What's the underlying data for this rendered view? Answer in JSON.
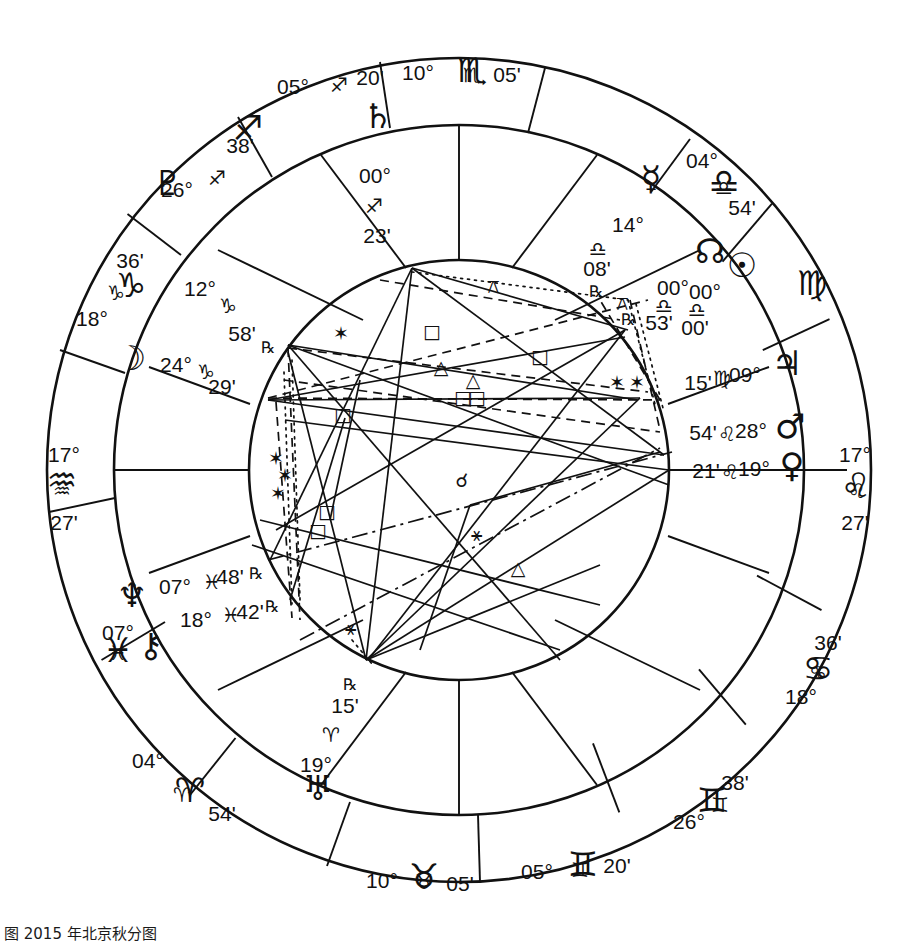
{
  "chart_data": {
    "type": "other",
    "caption": "å¾ 2015 年北京秋分图",
    "wheel": {
      "center_x": 459,
      "center_y": 470,
      "outer_radius": 415,
      "zodiac_inner_radius": 340,
      "house_ring_radius": 285,
      "inner_circle_radius": 210
    },
    "angles": {
      "ascendant": {
        "deg": "17°",
        "sign": "♌",
        "min": "27'",
        "label": "Ascendant"
      },
      "descendant": {
        "deg": "17°",
        "sign": "♒",
        "min": "27'",
        "label": "Descendant"
      },
      "midheaven": {
        "deg": "10°",
        "sign": "♏",
        "min": "05'",
        "label": "Midheaven"
      },
      "imum_coeli": {
        "deg": "10°",
        "sign": "♉",
        "min": "05'",
        "label": "Imum Coeli"
      }
    },
    "cusps": [
      {
        "id": "cusp-mc",
        "deg": "10°",
        "sign": "♏",
        "min": "05'",
        "x": 459,
        "y": 78,
        "anchor": "middle"
      },
      {
        "id": "cusp-11",
        "deg": "05°",
        "sign": "♐",
        "min": "20'",
        "x": 330,
        "y": 93,
        "anchor": "middle"
      },
      {
        "id": "cusp-12",
        "deg": "26°",
        "sign": "♐",
        "min": "38'",
        "x": 205,
        "y": 165,
        "anchor": "middle"
      },
      {
        "id": "cusp-1",
        "deg": "18°",
        "sign": "♑",
        "min": "36'",
        "x": 113,
        "y": 300,
        "anchor": "middle"
      },
      {
        "id": "cusp-dsc",
        "deg": "17°",
        "sign": "♒",
        "min": "27'",
        "x": 62,
        "y": 470,
        "anchor": "middle"
      },
      {
        "id": "cusp-2",
        "deg": "07°",
        "sign": "♓",
        "min": "",
        "x": 118,
        "y": 640,
        "anchor": "middle"
      },
      {
        "id": "cusp-3",
        "deg": "04°",
        "sign": "♈",
        "min": "54'",
        "x": 190,
        "y": 780,
        "anchor": "middle"
      },
      {
        "id": "cusp-ic",
        "deg": "10°",
        "sign": "♉",
        "min": "05'",
        "x": 410,
        "y": 884,
        "anchor": "middle"
      },
      {
        "id": "cusp-5",
        "deg": "05°",
        "sign": "♊",
        "min": "20'",
        "x": 580,
        "y": 877,
        "anchor": "middle"
      },
      {
        "id": "cusp-6",
        "deg": "26°",
        "sign": "♊",
        "min": "38'",
        "x": 705,
        "y": 805,
        "anchor": "middle"
      },
      {
        "id": "cusp-7",
        "deg": "18°",
        "sign": "♋",
        "min": "36'",
        "x": 805,
        "y": 665,
        "anchor": "middle"
      },
      {
        "id": "cusp-asc",
        "deg": "17°",
        "sign": "♌",
        "min": "27'",
        "x": 857,
        "y": 470,
        "anchor": "middle"
      },
      {
        "id": "cusp-8",
        "deg": "04°",
        "sign": "♎",
        "min": "54'",
        "x": 712,
        "y": 178,
        "anchor": "middle"
      },
      {
        "id": "cusp-9",
        "deg": "05°",
        "sign": "♐",
        "min": "20'",
        "x": 322,
        "y": 88,
        "anchor": "middle"
      }
    ],
    "cusp_labels": [
      {
        "name": "mc",
        "deg": "10°",
        "sign": "♏",
        "min": "05'",
        "dx": 418,
        "dy": 80,
        "sdx": 472,
        "sdy": 82,
        "mdx": 507,
        "mdy": 82
      },
      {
        "name": "h11",
        "deg": "05°",
        "sign": "♐",
        "min": "20'",
        "dx": 293,
        "dy": 94,
        "sdx": 339,
        "sdy": 92,
        "mdx": 370,
        "mdy": 85
      },
      {
        "name": "h12",
        "deg": "26°",
        "sign": "♐",
        "min": "38'",
        "dx": 177,
        "dy": 197,
        "sdx": 217,
        "sdy": 185,
        "mdx": 240,
        "mdy": 153
      },
      {
        "name": "h1",
        "deg": "18°",
        "sign": "♑",
        "min": "36'",
        "dx": 92,
        "dy": 326,
        "sdx": 116,
        "sdy": 300,
        "mdx": 130,
        "mdy": 268
      },
      {
        "name": "dsc",
        "deg": "17°",
        "sign": "♒",
        "min": "27'",
        "dx": 64,
        "dy": 462,
        "sdx": 62,
        "sdy": 498,
        "mdx": 64,
        "mdy": 530
      },
      {
        "name": "h2",
        "deg": "07°",
        "sign": "♓",
        "min": "",
        "dx": 118,
        "dy": 640,
        "sdx": 118,
        "sdy": 660,
        "mdx": 118,
        "mdy": 680
      },
      {
        "name": "h3",
        "deg": "04°",
        "sign": "♈",
        "min": "54'",
        "dx": 148,
        "dy": 768,
        "sdx": 182,
        "sdy": 802,
        "mdx": 222,
        "mdy": 821
      },
      {
        "name": "ic",
        "deg": "10°",
        "sign": "♉",
        "min": "05'",
        "dx": 382,
        "dy": 888,
        "sdx": 424,
        "sdy": 889,
        "mdx": 460,
        "mdy": 891
      },
      {
        "name": "h5",
        "deg": "05°",
        "sign": "♊",
        "min": "20'",
        "dx": 537,
        "dy": 879,
        "sdx": 580,
        "sdy": 877,
        "mdx": 617,
        "mdy": 873
      },
      {
        "name": "h6",
        "deg": "26°",
        "sign": "♊",
        "min": "38'",
        "dx": 689,
        "dy": 829,
        "sdx": 720,
        "sdy": 812,
        "mdx": 735,
        "mdy": 790
      },
      {
        "name": "h7",
        "deg": "18°",
        "sign": "♋",
        "min": "36'",
        "dx": 801,
        "dy": 704,
        "sdx": 818,
        "sdy": 680,
        "mdx": 828,
        "mdy": 650
      },
      {
        "name": "asc",
        "deg": "17°",
        "sign": "♌",
        "min": "27'",
        "dx": 855,
        "dy": 462,
        "sdx": 857,
        "sdy": 498,
        "mdx": 855,
        "mdy": 530
      },
      {
        "name": "h8",
        "deg": "04°",
        "sign": "♎",
        "min": "54'",
        "dx": 702,
        "dy": 168,
        "sdx": 724,
        "sdy": 195,
        "mdx": 742,
        "mdy": 215
      }
    ],
    "outer_sign_glyphs": [
      {
        "name": "sagittarius",
        "glyph": "♐",
        "x": 248,
        "y": 140
      },
      {
        "name": "capricorn",
        "glyph": "♑",
        "x": 131,
        "y": 297
      },
      {
        "name": "aquarius",
        "glyph": "♒",
        "x": 62,
        "y": 492
      },
      {
        "name": "pisces",
        "glyph": "♓",
        "x": 118,
        "y": 662
      },
      {
        "name": "aries",
        "glyph": "♈",
        "x": 190,
        "y": 802
      },
      {
        "name": "taurus",
        "glyph": "♉",
        "x": 424,
        "y": 888
      },
      {
        "name": "gemini",
        "glyph": "♊",
        "x": 583,
        "y": 876
      },
      {
        "name": "gemini2",
        "glyph": "♊",
        "x": 712,
        "y": 812
      },
      {
        "name": "cancer",
        "glyph": "♋",
        "x": 818,
        "y": 680
      },
      {
        "name": "leo",
        "glyph": "♌",
        "x": 856,
        "y": 497
      },
      {
        "name": "virgo",
        "glyph": "♍",
        "x": 812,
        "y": 295
      },
      {
        "name": "libra",
        "glyph": "♎",
        "x": 724,
        "y": 193
      },
      {
        "name": "scorpio",
        "glyph": "♏",
        "x": 472,
        "y": 82
      }
    ],
    "planets": [
      {
        "name": "saturn",
        "glyph": "♄",
        "deg": "00°",
        "sign": "♐",
        "min": "23'",
        "retro": false,
        "gx": 378,
        "gy": 128,
        "dx": 375,
        "dy": 183,
        "sx": 374,
        "sy": 213,
        "mx": 377,
        "my": 243,
        "rx": 0,
        "ry": 0
      },
      {
        "name": "mercury",
        "glyph": "☿",
        "deg": "14°",
        "sign": "♎",
        "min": "08'",
        "retro": true,
        "gx": 651,
        "gy": 190,
        "dx": 628,
        "dy": 232,
        "sx": 598,
        "sy": 256,
        "mx": 597,
        "my": 276,
        "rx": 596,
        "ry": 297
      },
      {
        "name": "north-node",
        "glyph": "☊",
        "deg": "00°",
        "sign": "♎",
        "min": "53'",
        "retro": true,
        "gx": 710,
        "gy": 263,
        "dx": 673,
        "dy": 295,
        "sx": 664,
        "sy": 313,
        "mx": 659,
        "my": 330,
        "rx": 628,
        "ry": 325
      },
      {
        "name": "sun",
        "glyph": "☉",
        "deg": "00°",
        "sign": "♎",
        "min": "00'",
        "retro": false,
        "gx": 742,
        "gy": 277,
        "dx": 705,
        "dy": 299,
        "sx": 697,
        "sy": 317,
        "mx": 695,
        "my": 335,
        "rx": 0,
        "ry": 0
      },
      {
        "name": "jupiter",
        "glyph": "♃",
        "deg": "09°",
        "sign": "♍",
        "min": "15'",
        "retro": false,
        "gx": 787,
        "gy": 375,
        "dx": 745,
        "dy": 382,
        "sx": 722,
        "sy": 385,
        "mx": 698,
        "my": 390,
        "rx": 0,
        "ry": 0
      },
      {
        "name": "mars",
        "glyph": "♂",
        "deg": "28°",
        "sign": "♌",
        "min": "54'",
        "retro": false,
        "gx": 790,
        "gy": 438,
        "dx": 751,
        "dy": 438,
        "sx": 727,
        "sy": 441,
        "mx": 703,
        "my": 440,
        "rx": 0,
        "ry": 0
      },
      {
        "name": "venus",
        "glyph": "♀",
        "deg": "19°",
        "sign": "♌",
        "min": "21'",
        "retro": false,
        "gx": 792,
        "gy": 477,
        "dx": 754,
        "dy": 476,
        "sx": 730,
        "sy": 479,
        "mx": 706,
        "my": 478,
        "rx": 0,
        "ry": 0
      },
      {
        "name": "pluto",
        "glyph": "♇",
        "deg": "12°",
        "sign": "♑",
        "min": "58'",
        "retro": true,
        "gx": 168,
        "gy": 195,
        "dx": 200,
        "dy": 296,
        "sx": 228,
        "sy": 313,
        "mx": 242,
        "my": 341,
        "rx": 268,
        "ry": 353
      },
      {
        "name": "moon",
        "glyph": "☽",
        "deg": "24°",
        "sign": "♑",
        "min": "29'",
        "retro": false,
        "gx": 131,
        "gy": 370,
        "dx": 176,
        "dy": 372,
        "sx": 206,
        "sy": 379,
        "mx": 222,
        "my": 394,
        "rx": 0,
        "ry": 0
      },
      {
        "name": "neptune",
        "glyph": "♆",
        "deg": "07°",
        "sign": "♓",
        "min": "48'",
        "retro": true,
        "gx": 132,
        "gy": 607,
        "dx": 175,
        "dy": 594,
        "sx": 212,
        "sy": 589,
        "mx": 230,
        "my": 584,
        "rx": 256,
        "ry": 579
      },
      {
        "name": "chiron",
        "glyph": "⚷",
        "deg": "18°",
        "sign": "♓",
        "min": "42'",
        "retro": true,
        "gx": 151,
        "gy": 657,
        "dx": 196,
        "dy": 627,
        "sx": 231,
        "sy": 622,
        "mx": 250,
        "my": 619,
        "rx": 272,
        "ry": 612
      },
      {
        "name": "uranus",
        "glyph": "♅",
        "deg": "19°",
        "sign": "♈",
        "min": "15'",
        "retro": true,
        "gx": 318,
        "gy": 800,
        "dx": 316,
        "dy": 772,
        "sx": 331,
        "sy": 742,
        "mx": 345,
        "my": 713,
        "rx": 350,
        "ry": 690
      }
    ],
    "aspect_symbols": [
      {
        "name": "square",
        "glyph": "□",
        "x": 432,
        "y": 338
      },
      {
        "name": "square",
        "glyph": "□",
        "x": 540,
        "y": 363
      },
      {
        "name": "square",
        "glyph": "□",
        "x": 343,
        "y": 421
      },
      {
        "name": "square",
        "glyph": "□",
        "x": 463,
        "y": 404
      },
      {
        "name": "square",
        "glyph": "□",
        "x": 477,
        "y": 404
      },
      {
        "name": "square",
        "glyph": "□",
        "x": 327,
        "y": 518
      },
      {
        "name": "square",
        "glyph": "□",
        "x": 318,
        "y": 537
      },
      {
        "name": "trine",
        "glyph": "△",
        "x": 441,
        "y": 374
      },
      {
        "name": "trine",
        "glyph": "△",
        "x": 473,
        "y": 387
      },
      {
        "name": "trine",
        "glyph": "△",
        "x": 518,
        "y": 575
      },
      {
        "name": "sextile",
        "glyph": "✶",
        "x": 341,
        "y": 340
      },
      {
        "name": "sextile",
        "glyph": "✶",
        "x": 617,
        "y": 389
      },
      {
        "name": "sextile",
        "glyph": "✶",
        "x": 637,
        "y": 389
      },
      {
        "name": "sextile",
        "glyph": "✶",
        "x": 276,
        "y": 465
      },
      {
        "name": "sextile",
        "glyph": "✶",
        "x": 285,
        "y": 482
      },
      {
        "name": "sextile",
        "glyph": "✶",
        "x": 278,
        "y": 500
      },
      {
        "name": "conjunction",
        "glyph": "☌",
        "x": 462,
        "y": 487
      },
      {
        "name": "semisextile",
        "glyph": "⚹",
        "x": 476,
        "y": 541
      },
      {
        "name": "semisextile",
        "glyph": "⚹",
        "x": 350,
        "y": 635
      },
      {
        "name": "quincunx",
        "glyph": "⚻",
        "x": 493,
        "y": 293
      },
      {
        "name": "quincunx",
        "glyph": "⚻",
        "x": 622,
        "y": 310
      }
    ]
  },
  "caption": {
    "text": "图 2015 年北京秋分图"
  }
}
